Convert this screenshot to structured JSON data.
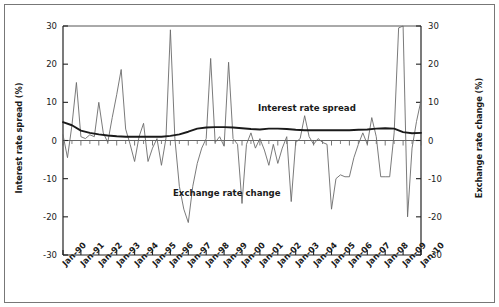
{
  "chart_data": {
    "type": "line",
    "title": "",
    "xlabel": "",
    "ylabel": "Interest rate spread (%)",
    "y2label": "Exchange rate change (%)",
    "ylim": [
      -30,
      30
    ],
    "y2lim": [
      -30,
      30
    ],
    "yticks": [
      30,
      20,
      10,
      0,
      -10,
      -20,
      -30
    ],
    "ytick_labels": [
      "30",
      "20",
      "10",
      "0",
      "-10",
      "-20",
      "-30"
    ],
    "y2ticks": [
      30,
      20,
      10,
      0,
      -10,
      -20,
      -30
    ],
    "y2tick_labels": [
      "30",
      "20",
      "10",
      "0",
      "-10",
      "-20",
      "-30"
    ],
    "grid": false,
    "legend_position": "inline-annotation",
    "xtick_labels": [
      "Jan-90",
      "Jan-91",
      "Jan-92",
      "Jan-93",
      "Jan-94",
      "Jan-95",
      "Jan-96",
      "Jan-97",
      "Jan-98",
      "Jan-99",
      "Jan-00",
      "Jan-01",
      "Jan-02",
      "Jan-03",
      "Jan-04",
      "Jan-05",
      "Jan-06",
      "Jan-07",
      "Jan-08",
      "Jan-09",
      "Jan-10"
    ],
    "x_start": 1990.0,
    "x_end": 2010.0,
    "series": [
      {
        "name": "Exchange rate change",
        "axis": "right",
        "color": "#6b6b6b",
        "x": [
          1990.0,
          1990.25,
          1990.5,
          1990.75,
          1991.0,
          1991.25,
          1991.5,
          1991.75,
          1992.0,
          1992.25,
          1992.5,
          1992.75,
          1993.0,
          1993.25,
          1993.5,
          1993.75,
          1994.0,
          1994.25,
          1994.5,
          1994.75,
          1995.0,
          1995.25,
          1995.5,
          1995.75,
          1996.0,
          1996.25,
          1996.5,
          1996.75,
          1997.0,
          1997.25,
          1997.5,
          1997.75,
          1998.0,
          1998.25,
          1998.5,
          1998.75,
          1999.0,
          1999.25,
          1999.5,
          1999.75,
          2000.0,
          2000.25,
          2000.5,
          2000.75,
          2001.0,
          2001.25,
          2001.5,
          2001.75,
          2002.0,
          2002.25,
          2002.5,
          2002.75,
          2003.0,
          2003.25,
          2003.5,
          2003.75,
          2004.0,
          2004.25,
          2004.5,
          2004.75,
          2005.0,
          2005.25,
          2005.5,
          2005.75,
          2006.0,
          2006.25,
          2006.5,
          2006.75,
          2007.0,
          2007.25,
          2007.5,
          2007.75,
          2008.0,
          2008.25,
          2008.5,
          2008.75,
          2009.0,
          2009.25,
          2009.5,
          2009.75,
          2010.0
        ],
        "values": [
          1.5,
          -4.5,
          4.0,
          15.2,
          1.0,
          0.5,
          1.5,
          1.0,
          10.0,
          2.0,
          -0.5,
          6.0,
          12.0,
          18.6,
          3.0,
          -1.0,
          -5.5,
          1.0,
          4.5,
          -5.5,
          -2.0,
          0.5,
          -6.5,
          0.5,
          29.0,
          0.5,
          -12.0,
          -18.0,
          -21.5,
          -12.0,
          -6.0,
          -2.0,
          0.5,
          21.5,
          -0.5,
          1.0,
          -1.5,
          20.5,
          0.5,
          -1.0,
          -16.5,
          -1.0,
          2.0,
          -2.0,
          0.5,
          -2.5,
          -6.5,
          -1.0,
          -6.0,
          -2.0,
          1.0,
          -16.0,
          -0.5,
          0.5,
          6.5,
          1.0,
          -1.0,
          0.5,
          -0.5,
          -1.0,
          -18.0,
          -10.0,
          -9.0,
          -9.5,
          -9.5,
          -4.5,
          -1.0,
          2.0,
          -1.0,
          6.0,
          1.0,
          -9.5,
          -9.5,
          -9.5,
          2.0,
          29.5,
          30.0,
          -20.0,
          -2.0,
          5.0,
          10.5
        ]
      },
      {
        "name": "Interest rate spread",
        "axis": "left",
        "color": "#1a1a1a",
        "x": [
          1990.0,
          1990.5,
          1991.0,
          1991.5,
          1992.0,
          1992.5,
          1993.0,
          1993.5,
          1994.0,
          1994.5,
          1995.0,
          1995.5,
          1996.0,
          1996.5,
          1997.0,
          1997.5,
          1998.0,
          1998.5,
          1999.0,
          1999.5,
          2000.0,
          2000.5,
          2001.0,
          2001.5,
          2002.0,
          2002.5,
          2003.0,
          2003.5,
          2004.0,
          2004.5,
          2005.0,
          2005.5,
          2006.0,
          2006.5,
          2007.0,
          2007.5,
          2008.0,
          2008.5,
          2009.0,
          2009.5,
          2010.0
        ],
        "values": [
          4.8,
          4.0,
          2.6,
          2.0,
          1.6,
          1.3,
          1.1,
          1.0,
          1.0,
          1.0,
          1.0,
          1.0,
          1.2,
          1.6,
          2.3,
          3.1,
          3.4,
          3.5,
          3.5,
          3.4,
          3.2,
          3.0,
          2.9,
          3.1,
          3.1,
          3.0,
          2.8,
          2.7,
          2.7,
          2.7,
          2.7,
          2.7,
          2.7,
          2.8,
          2.9,
          3.1,
          3.2,
          3.1,
          2.2,
          1.9,
          2.0
        ]
      }
    ],
    "annotations": [
      {
        "text": "Interest rate spread",
        "x_px": 258,
        "y_px": 103
      },
      {
        "text": "Exchange rate change",
        "x_px": 173,
        "y_px": 188
      }
    ]
  }
}
